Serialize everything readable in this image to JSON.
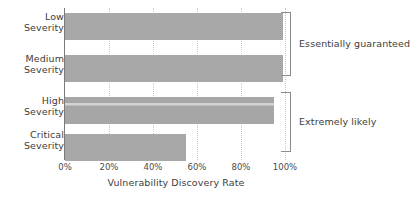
{
  "chart_data": {
    "type": "bar",
    "orientation": "horizontal",
    "title": "",
    "xlabel": "Vulnerability Discovery Rate",
    "ylabel": "",
    "categories": [
      "Low Severity",
      "Medium Severity",
      "High Severity",
      "Critical Severity"
    ],
    "category_lines": [
      [
        "Low",
        "Severity"
      ],
      [
        "Medium",
        "Severity"
      ],
      [
        "High",
        "Severity"
      ],
      [
        "Critical",
        "Severity"
      ]
    ],
    "values": [
      99,
      99,
      95,
      55
    ],
    "value_labels": [
      "99%",
      "99%",
      "95%",
      "55%"
    ],
    "xlim": [
      0,
      100
    ],
    "xticks": [
      0,
      20,
      40,
      60,
      80,
      100
    ],
    "xtick_labels": [
      "0%",
      "20%",
      "40%",
      "60%",
      "80%",
      "100%"
    ],
    "grid": "vertical-dotted",
    "legend": "none",
    "bar_color": "#a8a8a8",
    "grid_color": "#c8c8c8",
    "axis_color": "#7a7a7a",
    "text_color": "#3d3d3d",
    "annotations": [
      {
        "label": "Essentially guaranteed",
        "covers": [
          "Low Severity",
          "Medium Severity"
        ],
        "bracket": "right-brace"
      },
      {
        "label": "Extremely likely",
        "covers": [
          "High Severity",
          "Critical Severity"
        ],
        "bracket": "right-brace"
      }
    ]
  }
}
